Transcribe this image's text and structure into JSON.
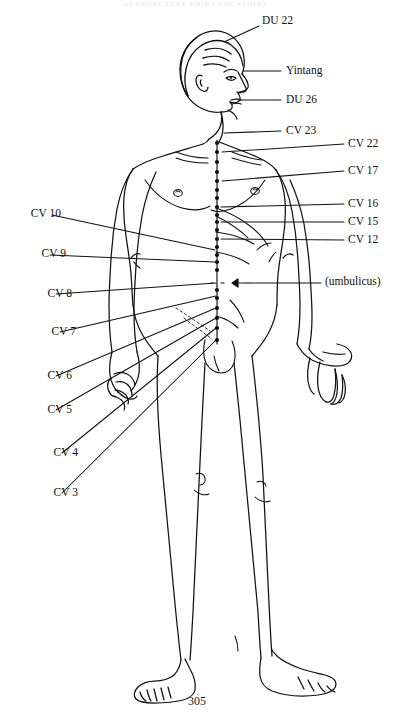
{
  "document": {
    "running_header": "ACUPUNCTURE POINT LOCATIONS",
    "page_number": "305",
    "figure_caption": ""
  },
  "figure": {
    "view": "anterior body with head in right profile",
    "meridian": "Conception Vessel (Ren Mai) midline point column"
  },
  "labels_right": [
    {
      "id": "du22",
      "text": "DU 22",
      "x": 262,
      "y": 15,
      "line": {
        "x1": 259,
        "y1": 26,
        "x2": 224,
        "y2": 42
      }
    },
    {
      "id": "yintang",
      "text": "Yintang",
      "x": 286,
      "y": 65,
      "line": {
        "x1": 281,
        "y1": 71,
        "x2": 243,
        "y2": 71
      }
    },
    {
      "id": "du26",
      "text": "DU 26",
      "x": 286,
      "y": 94,
      "line": {
        "x1": 281,
        "y1": 100,
        "x2": 240,
        "y2": 100
      }
    },
    {
      "id": "cv23",
      "text": "CV 23",
      "x": 286,
      "y": 125,
      "line": {
        "x1": 281,
        "y1": 131,
        "x2": 224,
        "y2": 133
      }
    },
    {
      "id": "cv22",
      "text": "CV 22",
      "x": 348,
      "y": 138,
      "line": {
        "x1": 344,
        "y1": 144,
        "x2": 222,
        "y2": 152
      }
    },
    {
      "id": "cv17",
      "text": "CV 17",
      "x": 348,
      "y": 165,
      "line": {
        "x1": 344,
        "y1": 171,
        "x2": 222,
        "y2": 181
      }
    },
    {
      "id": "cv16",
      "text": "CV 16",
      "x": 348,
      "y": 198,
      "line": {
        "x1": 344,
        "y1": 204,
        "x2": 221,
        "y2": 207
      }
    },
    {
      "id": "cv15",
      "text": "CV 15",
      "x": 348,
      "y": 216,
      "line": {
        "x1": 344,
        "y1": 222,
        "x2": 221,
        "y2": 222
      }
    },
    {
      "id": "cv12",
      "text": "CV 12",
      "x": 348,
      "y": 234,
      "line": {
        "x1": 344,
        "y1": 240,
        "x2": 221,
        "y2": 239
      }
    },
    {
      "id": "umb",
      "text": "(umbulicus)",
      "x": 325,
      "y": 276,
      "line": {
        "x1": 321,
        "y1": 283,
        "x2": 248,
        "y2": 283
      }
    }
  ],
  "labels_left": [
    {
      "id": "cv10",
      "text": "CV 10",
      "x": 13,
      "y": 208,
      "line": {
        "x1": 52,
        "y1": 215,
        "x2": 215,
        "y2": 250
      }
    },
    {
      "id": "cv9",
      "text": "CV 9",
      "x": 18,
      "y": 248,
      "line": {
        "x1": 50,
        "y1": 255,
        "x2": 215,
        "y2": 262
      }
    },
    {
      "id": "cv8",
      "text": "CV 8",
      "x": 24,
      "y": 288,
      "line": {
        "x1": 56,
        "y1": 294,
        "x2": 216,
        "y2": 283
      }
    },
    {
      "id": "cv7",
      "text": "CV 7",
      "x": 28,
      "y": 326,
      "line": {
        "x1": 60,
        "y1": 332,
        "x2": 216,
        "y2": 296
      }
    },
    {
      "id": "cv6",
      "text": "CV 6",
      "x": 24,
      "y": 370,
      "line": {
        "x1": 56,
        "y1": 376,
        "x2": 216,
        "y2": 308
      }
    },
    {
      "id": "cv5",
      "text": "CV 5",
      "x": 24,
      "y": 404,
      "line": {
        "x1": 56,
        "y1": 410,
        "x2": 216,
        "y2": 318
      }
    },
    {
      "id": "cv4",
      "text": "CV 4",
      "x": 30,
      "y": 447,
      "line": {
        "x1": 62,
        "y1": 453,
        "x2": 216,
        "y2": 328
      }
    },
    {
      "id": "cv3",
      "text": "CV 3",
      "x": 30,
      "y": 487,
      "line": {
        "x1": 62,
        "y1": 493,
        "x2": 216,
        "y2": 340
      }
    }
  ],
  "meridian_points": [
    {
      "y": 143
    },
    {
      "y": 152
    },
    {
      "y": 162
    },
    {
      "y": 172
    },
    {
      "y": 181
    },
    {
      "y": 190
    },
    {
      "y": 198
    },
    {
      "y": 207
    },
    {
      "y": 215
    },
    {
      "y": 222
    },
    {
      "y": 230
    },
    {
      "y": 239
    },
    {
      "y": 247
    },
    {
      "y": 255
    },
    {
      "y": 262
    },
    {
      "y": 270
    },
    {
      "y": 290
    },
    {
      "y": 298
    },
    {
      "y": 308
    },
    {
      "y": 318
    },
    {
      "y": 328
    },
    {
      "y": 340
    }
  ],
  "colors": {
    "ink": "#111111",
    "paper": "#ffffff",
    "header_faint": "#c9c9d2"
  }
}
